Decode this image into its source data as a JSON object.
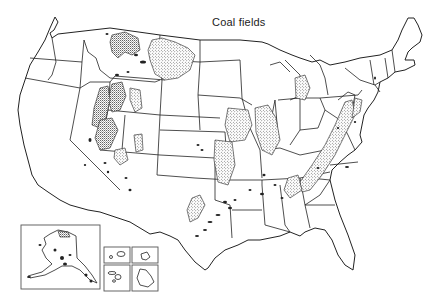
{
  "title": "Coal fields",
  "map": {
    "subject": "Coal fields of the United States",
    "region": "Contiguous United States",
    "insets": [
      {
        "label": "Alaska"
      },
      {
        "label": "Hawaii (Kauai/Oahu)"
      },
      {
        "label": "Hawaii (Maui)"
      },
      {
        "label": "Hawaii (Molokai/Lanai)"
      },
      {
        "label": "Hawaii (Big Island)"
      }
    ],
    "legend": {
      "stippled_area": "Coal field"
    },
    "colors": {
      "line": "#222222",
      "background": "#ffffff",
      "stipple": "#333333"
    }
  }
}
